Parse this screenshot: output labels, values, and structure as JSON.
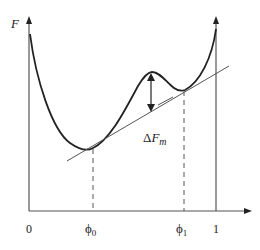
{
  "diagram": {
    "y_axis_label": "F",
    "annotation": {
      "delta": "Δ",
      "F": "F",
      "sub": "m"
    },
    "x_ticks": [
      {
        "label": "0",
        "sub": ""
      },
      {
        "label": "ϕ",
        "sub": "0"
      },
      {
        "label": "ϕ",
        "sub": "1"
      },
      {
        "label": "1",
        "sub": ""
      }
    ],
    "colors": {
      "curve": "#222222",
      "axis": "#555555",
      "tangent": "#555555"
    }
  }
}
